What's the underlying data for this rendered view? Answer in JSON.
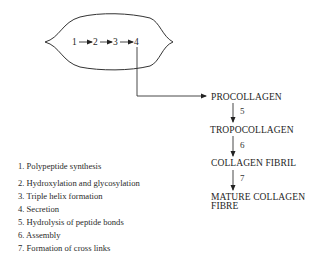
{
  "cell": {
    "steps": [
      "1",
      "2",
      "3",
      "4"
    ]
  },
  "pathway": {
    "stages": [
      {
        "label": "PROCOLLAGEN"
      },
      {
        "label": "TROPOCOLLAGEN"
      },
      {
        "label": "COLLAGEN FIBRIL"
      },
      {
        "label": "MATURE COLLAGEN",
        "label2": "FIBRE"
      }
    ],
    "arrows": [
      "5",
      "6",
      "7"
    ]
  },
  "legend": {
    "items": [
      "1. Polypeptide synthesis",
      "2. Hydroxylation and glycosylation",
      "3. Triple helix formation",
      "4. Secretion",
      "5. Hydrolysis of peptide bonds",
      "6. Assembly",
      "7. Formation of cross links"
    ]
  },
  "colors": {
    "line": "#333333",
    "text": "#1e1e1e"
  }
}
